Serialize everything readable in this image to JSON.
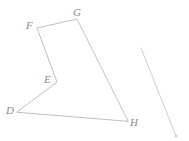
{
  "figure": {
    "canvas": {
      "width": 189,
      "height": 141,
      "background": "#ffffff"
    },
    "style": {
      "stroke_color": "#b8b8b8",
      "stroke_width": 0.9,
      "label_color": "#8b8b8b",
      "label_font_size": 11,
      "label_font_style": "italic"
    },
    "vertices": [
      {
        "name": "D",
        "label": "D",
        "x": 17,
        "y": 112,
        "label_x": 6,
        "label_y": 105
      },
      {
        "name": "E",
        "label": "E",
        "x": 57,
        "y": 82,
        "label_x": 44,
        "label_y": 74
      },
      {
        "name": "F",
        "label": "F",
        "x": 37,
        "y": 28,
        "label_x": 26,
        "label_y": 20
      },
      {
        "name": "G",
        "label": "G",
        "x": 77,
        "y": 19,
        "label_x": 73,
        "label_y": 7
      },
      {
        "name": "H",
        "label": "H",
        "x": 128,
        "y": 121,
        "label_x": 130,
        "label_y": 117
      }
    ],
    "polygon": {
      "name": "pentagon-DEFGH",
      "closed": true,
      "order": [
        "D",
        "E",
        "F",
        "G",
        "H"
      ],
      "points": "17,112 57,82 37,28 77,19 128,121",
      "edges": [
        {
          "from": "D",
          "to": "E"
        },
        {
          "from": "E",
          "to": "F"
        },
        {
          "from": "F",
          "to": "G"
        },
        {
          "from": "G",
          "to": "H"
        },
        {
          "from": "H",
          "to": "D"
        }
      ]
    },
    "segments": [
      {
        "name": "unlabeled-segment",
        "x1": 141,
        "y1": 48,
        "x2": 176,
        "y2": 136,
        "endpoint_marker": {
          "x": 176,
          "y": 136,
          "r": 1.3
        }
      }
    ]
  }
}
